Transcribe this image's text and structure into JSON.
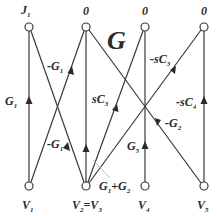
{
  "title": "G",
  "colors": {
    "line": "#3a3a3a",
    "node_fill": "#ffffff",
    "text": "#2a2a2a"
  },
  "top_nodes": [
    {
      "id": "J1",
      "label": "J",
      "sub": "1",
      "x": 29,
      "y": 27
    },
    {
      "id": "T2",
      "label": "0",
      "sub": "",
      "x": 86,
      "y": 27
    },
    {
      "id": "T3",
      "label": "0",
      "sub": "",
      "x": 145,
      "y": 27
    },
    {
      "id": "T4",
      "label": "0",
      "sub": "",
      "x": 204,
      "y": 27
    }
  ],
  "bottom_nodes": [
    {
      "id": "V1",
      "label": "V",
      "sub": "1",
      "x": 29,
      "y": 186
    },
    {
      "id": "V23",
      "label": "V",
      "sub": "2",
      "label2": "=V",
      "sub2": "3",
      "x": 86,
      "y": 186
    },
    {
      "id": "V4",
      "label": "V",
      "sub": "4",
      "x": 145,
      "y": 186
    },
    {
      "id": "V5",
      "label": "V",
      "sub": "5",
      "x": 204,
      "y": 186
    }
  ],
  "edges": [
    {
      "from": "V1",
      "to": "J1",
      "label": "G",
      "sub": "1",
      "prefix": ""
    },
    {
      "from": "V1",
      "to": "T2",
      "label": "G",
      "sub": "1",
      "prefix": "-"
    },
    {
      "from": "V23",
      "to": "J1",
      "label": "G",
      "sub": "1",
      "prefix": "-"
    },
    {
      "from": "V23",
      "to": "T2",
      "label": "G",
      "sub": "1",
      "prefix": "",
      "label_text": "G1+G2"
    },
    {
      "from": "V23",
      "to": "T3",
      "label": "sC",
      "sub": "3",
      "prefix": ""
    },
    {
      "from": "V23",
      "to": "T4",
      "label": "sC",
      "sub": "3",
      "prefix": "-"
    },
    {
      "from": "V4",
      "to": "T3",
      "label": "G",
      "sub": "5",
      "prefix": ""
    },
    {
      "from": "V5",
      "to": "T2",
      "label": "G",
      "sub": "2",
      "prefix": "-"
    },
    {
      "from": "V5",
      "to": "T4",
      "label": "sC",
      "sub": "4",
      "prefix": "-"
    }
  ],
  "labels": {
    "J1": "J",
    "J1_sub": "1",
    "zero": "0",
    "V1": "V",
    "V1_sub": "1",
    "V2": "V",
    "V2_sub": "2",
    "eq": "=",
    "V3": "V",
    "V3_sub": "3",
    "V4": "V",
    "V4_sub": "4",
    "V5": "V",
    "V5_sub": "5",
    "e_G1": "G",
    "e_G1_sub": "1",
    "e_negG1_upper": "-G",
    "e_negG1_upper_sub": "1",
    "e_negG1_lower": "-G",
    "e_negG1_lower_sub": "1",
    "e_sC3": "sC",
    "e_sC3_sub": "3",
    "e_negsC3": "-sC",
    "e_negsC3_sub": "3",
    "e_negsC4": "-sC",
    "e_negsC4_sub": "4",
    "e_negG2": "-G",
    "e_negG2_sub": "2",
    "e_G5": "G",
    "e_G5_sub": "5",
    "e_G1pG2_a": "G",
    "e_G1pG2_a_sub": "1",
    "e_G1pG2_plus": "+G",
    "e_G1pG2_b_sub": "2",
    "title": "G"
  }
}
